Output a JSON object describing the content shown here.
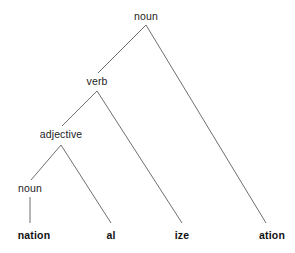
{
  "figure": {
    "type": "morphological-derivation-tree",
    "background_color": "#ffffff",
    "line_color": "#6f6f6f",
    "text_color": "#1d1d1d"
  },
  "nodes": {
    "root_noun": {
      "label": "noun",
      "x": 146,
      "y": 16,
      "kind": "internal"
    },
    "verb": {
      "label": "verb",
      "x": 97,
      "y": 81,
      "kind": "internal"
    },
    "adjective": {
      "label": "adjective",
      "x": 61,
      "y": 134,
      "kind": "internal"
    },
    "leaf_noun": {
      "label": "noun",
      "x": 30,
      "y": 188,
      "kind": "internal"
    },
    "nation": {
      "label": "nation",
      "x": 34,
      "y": 235,
      "kind": "leaf"
    },
    "al": {
      "label": "al",
      "x": 111,
      "y": 235,
      "kind": "leaf"
    },
    "ize": {
      "label": "ize",
      "x": 182,
      "y": 235,
      "kind": "leaf"
    },
    "ation": {
      "label": "ation",
      "x": 272,
      "y": 235,
      "kind": "leaf"
    }
  },
  "edges": [
    {
      "from": "root_noun",
      "to": "verb",
      "path": "M146,25 L98,73"
    },
    {
      "from": "root_noun",
      "to": "ation",
      "path": "M146,25 L266,223"
    },
    {
      "from": "verb",
      "to": "adjective",
      "path": "M97,91 L62,126"
    },
    {
      "from": "verb",
      "to": "ize",
      "path": "M97,91 L182,223"
    },
    {
      "from": "adjective",
      "to": "leaf_noun",
      "path": "M61,145 L31,180"
    },
    {
      "from": "adjective",
      "to": "al",
      "path": "M61,145 L111,223"
    },
    {
      "from": "leaf_noun",
      "to": "nation",
      "path": "M30,197 L30,223"
    }
  ]
}
